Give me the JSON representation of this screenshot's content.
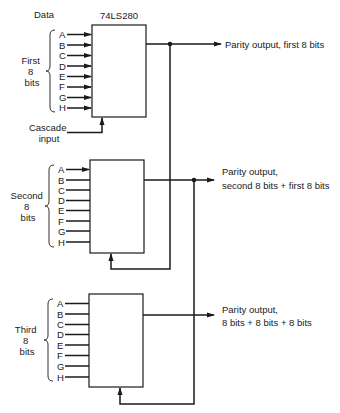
{
  "chip_label": "74LS280",
  "data_label": "Data",
  "cascade_label": [
    "Cascade",
    "input"
  ],
  "pins": [
    "A",
    "B",
    "C",
    "D",
    "E",
    "F",
    "G",
    "H"
  ],
  "stages": [
    {
      "group_label": [
        "First",
        "8",
        "bits"
      ],
      "output_label": [
        "Parity output, first 8 bits"
      ],
      "input_arrows": "all"
    },
    {
      "group_label": [
        "Second",
        "8",
        "bits"
      ],
      "output_label": [
        "Parity output,",
        "second 8 bits + first 8 bits"
      ],
      "input_arrows": "first"
    },
    {
      "group_label": [
        "Third",
        "8",
        "bits"
      ],
      "output_label": [
        "Parity output,",
        "8 bits + 8 bits + 8 bits"
      ],
      "input_arrows": "none"
    }
  ],
  "colors": {
    "ink": "#1a1a1a",
    "background": "#ffffff"
  }
}
